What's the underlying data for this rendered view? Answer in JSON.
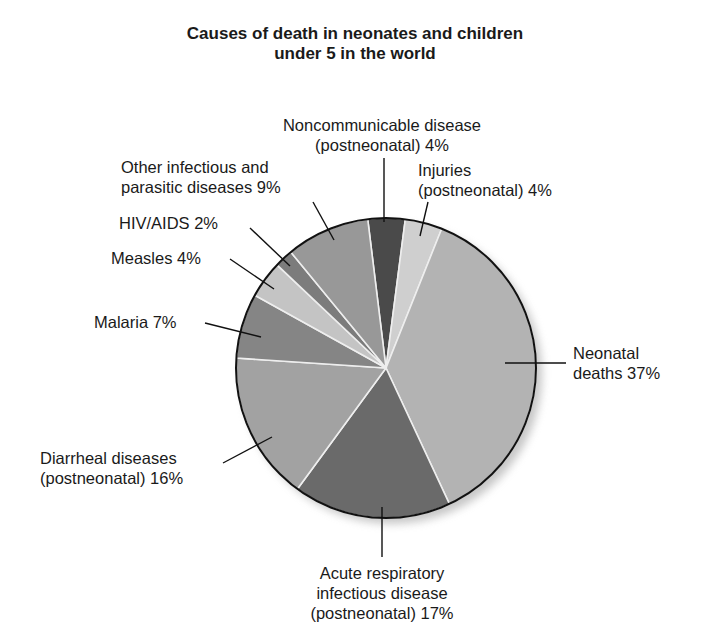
{
  "chart_data": {
    "type": "pie",
    "title": "Causes of death in neonates and children under 5 in the world",
    "title_lines": [
      "Causes of death in neonates and children",
      "under 5 in the world"
    ],
    "slices": [
      {
        "label": "Noncommunicable disease (postneonatal)",
        "value": 4,
        "color": "#4a4a4a"
      },
      {
        "label": "Injuries (postneonatal)",
        "value": 4,
        "color": "#cfcfcf"
      },
      {
        "label": "Neonatal deaths",
        "value": 37,
        "color": "#b3b3b3"
      },
      {
        "label": "Acute respiratory infectious disease (postneonatal)",
        "value": 17,
        "color": "#6a6a6a"
      },
      {
        "label": "Diarrheal diseases (postneonatal)",
        "value": 16,
        "color": "#a2a2a2"
      },
      {
        "label": "Malaria",
        "value": 7,
        "color": "#858585"
      },
      {
        "label": "Measles",
        "value": 4,
        "color": "#c4c4c4"
      },
      {
        "label": "HIV/AIDS",
        "value": 2,
        "color": "#7c7c7c"
      },
      {
        "label": "Other infectious and parasitic diseases",
        "value": 9,
        "color": "#989898"
      }
    ],
    "start_angle_deg": -7,
    "legend": "none (direct labels with leader lines)"
  },
  "labels": {
    "ncd": [
      "Noncommunicable disease",
      "(postneonatal) 4%"
    ],
    "injuries": [
      "Injuries",
      "(postneonatal) 4%"
    ],
    "neonatal": [
      "Neonatal",
      "deaths 37%"
    ],
    "ari": [
      "Acute respiratory",
      "infectious disease",
      "(postneonatal) 17%"
    ],
    "diarrheal": [
      "Diarrheal diseases",
      "(postneonatal) 16%"
    ],
    "malaria": "Malaria 7%",
    "measles": "Measles 4%",
    "hiv": "HIV/AIDS 2%",
    "other": [
      "Other infectious and",
      "parasitic diseases 9%"
    ]
  }
}
